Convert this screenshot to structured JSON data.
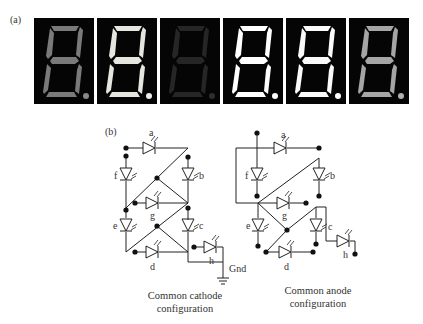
{
  "figure": {
    "panel_a_label": "(a)",
    "panel_b_label": "(b)"
  },
  "displays": [
    {
      "id": "display-1",
      "shows": "8.",
      "segment_color": "#7a7a7a",
      "dp_color": "#8a8a8a"
    },
    {
      "id": "display-2",
      "shows": "8.",
      "segment_color": "#e6e6e0",
      "dp_color": "#eeeeee"
    },
    {
      "id": "display-3",
      "shows": "8.",
      "segment_color": "#262626",
      "dp_color": "#2e2e2e"
    },
    {
      "id": "display-4",
      "shows": "8.",
      "segment_color": "#ffffff",
      "dp_color": "#ffffff"
    },
    {
      "id": "display-5",
      "shows": "8.",
      "segment_color": "#fafafa",
      "dp_color": "#ffffff"
    },
    {
      "id": "display-6",
      "shows": "8.",
      "segment_color": "#a5a5a5",
      "dp_color": "#b0b0b0"
    }
  ],
  "circuits": {
    "common_cathode": {
      "segments": [
        "a",
        "b",
        "c",
        "d",
        "e",
        "f",
        "g",
        "h"
      ],
      "ground_label": "Gnd",
      "caption_line1": "Common cathode",
      "caption_line2": "configuration"
    },
    "common_anode": {
      "segments": [
        "a",
        "b",
        "c",
        "d",
        "e",
        "f",
        "g",
        "h"
      ],
      "caption_line1": "Common anode",
      "caption_line2": "configuration"
    }
  },
  "colors": {
    "display_background": "#050505",
    "wire": "#222222"
  }
}
